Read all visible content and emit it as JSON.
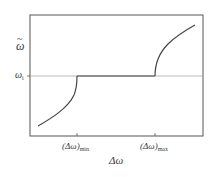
{
  "figure": {
    "y_axis_label": "ω",
    "y_axis_label_accent": "~",
    "y_reference_label": "ω",
    "y_reference_subscript": "i",
    "x_axis_label": "Δω",
    "x_tick_min_main": "(Δω)",
    "x_tick_min_subscript": "min",
    "x_tick_max_main": "(Δω)",
    "x_tick_max_subscript": "max"
  },
  "colors": {
    "axis": "#555555",
    "curve": "#444444",
    "reference_line": "#aaaaaa",
    "background": "#ffffff"
  },
  "geometry": {
    "plot_box": {
      "x": 30,
      "y": 15,
      "width": 173,
      "height": 121
    },
    "reference_y": 76,
    "tick_min_x": 77,
    "tick_max_x": 155
  },
  "curves": {
    "left_branch": "M38,126 C52,118 68,108 74,95 C77,88 77,80 77,76",
    "plateau": "M77,76 L155,76",
    "right_branch": "M155,76 C155,64 160,52 168,44 C176,36 186,30 195,25"
  }
}
